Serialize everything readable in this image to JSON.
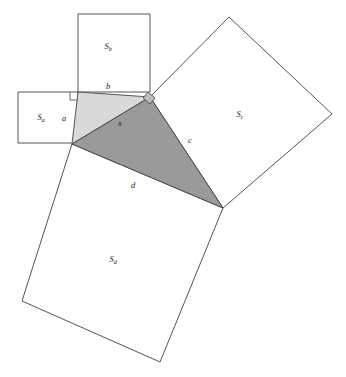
{
  "figure": {
    "title": "",
    "background_color": "#ffffff",
    "width": 346,
    "height": 377,
    "colors": {
      "outline_stroke": "#555555",
      "light_triangle_fill": "#d9d9d9",
      "dark_triangle_fill": "#9a9a9a",
      "label_color": "#1a1a1a"
    }
  },
  "labels": {
    "square_a": {
      "base": "S",
      "sub": "a",
      "x": 41,
      "y": 120
    },
    "square_b": {
      "base": "S",
      "sub": "b",
      "x": 108,
      "y": 49
    },
    "square_c": {
      "base": "S",
      "sub": "c",
      "x": 240,
      "y": 117
    },
    "square_d": {
      "base": "S",
      "sub": "d",
      "x": 113,
      "y": 262
    },
    "side_a": {
      "text": "a",
      "x": 64,
      "y": 121
    },
    "side_b": {
      "text": "b",
      "x": 108,
      "y": 89
    },
    "side_x": {
      "text": "x",
      "x": 120,
      "y": 126
    },
    "side_c": {
      "text": "c",
      "x": 190,
      "y": 143
    },
    "side_d": {
      "text": "d",
      "x": 133,
      "y": 188
    }
  },
  "shapes": {
    "square_a_points": "18,92 78,92 78,143 18,143",
    "square_b_points": "78,14 150,14 150,92 78,92",
    "square_c_points": "150,97 229,17 332,114 223,208",
    "square_d_points": "72,144 223,208 160,362 22,301",
    "triangle_light_points": "72,144 78,92 150,97",
    "triangle_dark_points": "72,144 150,97 223,208",
    "right_angle_a_points": "70,92 70,100 78,100",
    "right_angle_apex_points": "143,98 148,92 155,98 150,104"
  },
  "notes": {
    "description": "Four squares constructed on the sides of two adjoining right triangles",
    "light_triangle": "legs a and b, hypotenuse x",
    "dark_triangle": "legs x and c, hypotenuse d"
  }
}
